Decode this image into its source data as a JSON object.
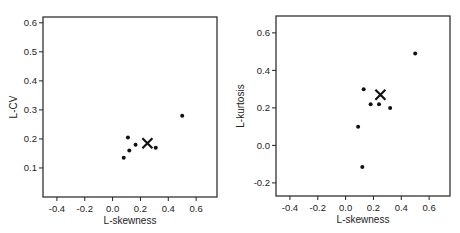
{
  "chart_data": [
    {
      "type": "scatter",
      "title": "",
      "xlabel": "L-skewness",
      "ylabel": "L-CV",
      "xlim": [
        -0.5,
        0.75
      ],
      "ylim": [
        0.0,
        0.62
      ],
      "xticks": [
        "-0.4",
        "-0.2",
        "0.0",
        "0.2",
        "0.4",
        "0.6"
      ],
      "yticks": [
        "0.1",
        "0.2",
        "0.3",
        "0.4",
        "0.5",
        "0.6"
      ],
      "grid": false,
      "series": [
        {
          "name": "sites",
          "marker": "dot",
          "points": [
            {
              "x": 0.11,
              "y": 0.205
            },
            {
              "x": 0.12,
              "y": 0.16
            },
            {
              "x": 0.08,
              "y": 0.135
            },
            {
              "x": 0.165,
              "y": 0.18
            },
            {
              "x": 0.31,
              "y": 0.17
            },
            {
              "x": 0.5,
              "y": 0.28
            }
          ]
        },
        {
          "name": "regional average",
          "marker": "x",
          "points": [
            {
              "x": 0.25,
              "y": 0.185
            }
          ]
        }
      ]
    },
    {
      "type": "scatter",
      "title": "",
      "xlabel": "L-skewness",
      "ylabel": "L-kurtosis",
      "xlim": [
        -0.5,
        0.75
      ],
      "ylim": [
        -0.27,
        0.69
      ],
      "xticks": [
        "-0.4",
        "-0.2",
        "0.0",
        "0.2",
        "0.4",
        "0.6"
      ],
      "yticks": [
        "-0.2",
        "0.0",
        "0.2",
        "0.4",
        "0.6"
      ],
      "grid": false,
      "series": [
        {
          "name": "sites",
          "marker": "dot",
          "points": [
            {
              "x": 0.5,
              "y": 0.49
            },
            {
              "x": 0.13,
              "y": 0.3
            },
            {
              "x": 0.18,
              "y": 0.22
            },
            {
              "x": 0.24,
              "y": 0.22
            },
            {
              "x": 0.32,
              "y": 0.2
            },
            {
              "x": 0.09,
              "y": 0.1
            },
            {
              "x": 0.12,
              "y": -0.115
            }
          ]
        },
        {
          "name": "regional average",
          "marker": "x",
          "points": [
            {
              "x": 0.25,
              "y": 0.27
            }
          ]
        }
      ]
    }
  ]
}
